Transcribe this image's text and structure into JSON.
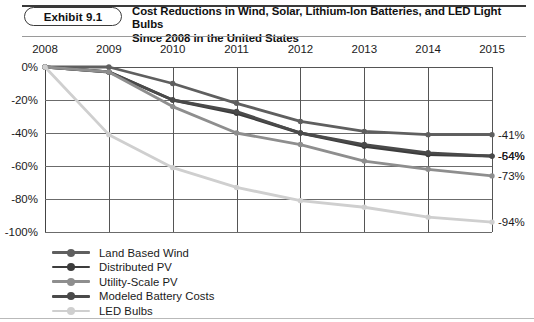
{
  "header": {
    "exhibit_label": "Exhibit 9.1",
    "title_line_1": "Cost Reductions in Wind, Solar, Lithium-Ion Batteries, and LED Light Bulbs",
    "title_line_2": "Since 2008 in the United States"
  },
  "colors": {
    "land_based_wind": "#5f5f5f",
    "distributed_pv": "#3c3c3c",
    "utility_scale_pv": "#8e8e8e",
    "modeled_battery_costs": "#4a4a4a",
    "led_bulbs": "#cfcfcf",
    "axis": "#555555",
    "text": "#1a1a1a"
  },
  "chart_data": {
    "type": "line",
    "title": "Cost Reductions in Wind, Solar, Lithium-Ion Batteries, and LED Light Bulbs Since 2008 in the United States",
    "xlabel": "",
    "ylabel": "",
    "categories": [
      "2008",
      "2009",
      "2010",
      "2011",
      "2012",
      "2013",
      "2014",
      "2015"
    ],
    "x_tick_labels": [
      "2008",
      "2009",
      "2010",
      "2011",
      "2012",
      "2013",
      "2014",
      "2015"
    ],
    "y_tick_labels": [
      "0%",
      "-20%",
      "-40%",
      "-60%",
      "-80%",
      "-100%"
    ],
    "y_tick_values": [
      0,
      -20,
      -40,
      -60,
      -80,
      -100
    ],
    "ylim": [
      -100,
      0
    ],
    "grid": true,
    "x_axis_position": "top",
    "legend_position": "bottom-left",
    "series": [
      {
        "name": "Land Based Wind",
        "color": "#5f5f5f",
        "values": [
          0,
          0,
          -10,
          -22,
          -33,
          -39,
          -41,
          -41
        ],
        "end_label": "-41%"
      },
      {
        "name": "Distributed PV",
        "color": "#3c3c3c",
        "values": [
          0,
          -3,
          -20,
          -27,
          -40,
          -47,
          -52,
          -54
        ],
        "end_label": "-54%"
      },
      {
        "name": "Utility-Scale PV",
        "color": "#8e8e8e",
        "values": [
          0,
          -3,
          -24,
          -40,
          -45,
          -55,
          -60,
          -64
        ],
        "end_label": "-64%"
      },
      {
        "name": "Modeled Battery Costs",
        "color": "#4a4a4a",
        "values": [
          0,
          -3,
          -20,
          -27,
          -40,
          -47,
          -52,
          -54
        ],
        "end_label": "-73%"
      },
      {
        "name": "LED Bulbs",
        "color": "#cfcfcf",
        "values": [
          0,
          -41,
          -60,
          -72,
          -81,
          -85,
          -91,
          -94
        ],
        "end_label": "-94%"
      }
    ],
    "series_render": [
      {
        "name": "Land Based Wind",
        "color": "#5f5f5f",
        "width": 2.8,
        "values": [
          0,
          0,
          -10,
          -22,
          -33,
          -39,
          -41,
          -41
        ],
        "end_label": "-41%"
      },
      {
        "name": "Distributed PV",
        "color": "#3c3c3c",
        "width": 3.0,
        "values": [
          0,
          -3,
          -20,
          -28,
          -40,
          -48,
          -53,
          -54
        ],
        "end_label": "-54%"
      },
      {
        "name": "Modeled Battery Costs",
        "color": "#4a4a4a",
        "width": 2.8,
        "values": [
          0,
          -3,
          -20,
          -27,
          -40,
          -47,
          -52,
          -54
        ],
        "end_label": "-64%"
      },
      {
        "name": "Utility-Scale PV",
        "color": "#8e8e8e",
        "width": 2.8,
        "values": [
          0,
          -3,
          -24,
          -40,
          -47,
          -57,
          -62,
          -66
        ],
        "end_label": "-73%"
      },
      {
        "name": "LED Bulbs",
        "color": "#cfcfcf",
        "width": 2.8,
        "values": [
          0,
          -41,
          -61,
          -73,
          -81,
          -85,
          -91,
          -94
        ],
        "end_label": "-94%"
      }
    ],
    "end_labels": [
      "-41%",
      "-54%",
      "-64%",
      "-73%",
      "-94%"
    ]
  },
  "legend": {
    "items": [
      {
        "label": "Land Based Wind",
        "color": "#5f5f5f"
      },
      {
        "label": "Distributed PV",
        "color": "#3c3c3c"
      },
      {
        "label": "Utility-Scale PV",
        "color": "#8e8e8e"
      },
      {
        "label": "Modeled Battery Costs",
        "color": "#4a4a4a"
      },
      {
        "label": "LED Bulbs",
        "color": "#cfcfcf"
      }
    ]
  }
}
